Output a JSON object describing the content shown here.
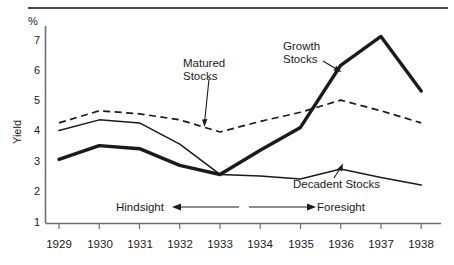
{
  "chart_data": {
    "type": "line",
    "title": "",
    "subtitle": "",
    "xlabel": "",
    "ylabel": "Yield",
    "yunit": "%",
    "categories": [
      "1929",
      "1930",
      "1931",
      "1932",
      "1933",
      "1934",
      "1935",
      "1936",
      "1937",
      "1938"
    ],
    "x": [
      1929,
      1930,
      1931,
      1932,
      1933,
      1934,
      1935,
      1936,
      1937,
      1938
    ],
    "xlim": [
      1929,
      1938
    ],
    "ylim": [
      1,
      7
    ],
    "yticks": [
      1,
      2,
      3,
      4,
      5,
      6,
      7
    ],
    "grid": false,
    "legend": "inline-annotations",
    "series": [
      {
        "name": "Growth Stocks",
        "style": "thick-solid",
        "color": "#1a1a1a",
        "values": [
          3.1,
          3.55,
          3.45,
          2.9,
          2.6,
          3.4,
          4.15,
          6.2,
          7.15,
          5.35
        ]
      },
      {
        "name": "Matured Stocks",
        "style": "dashed",
        "color": "#1a1a1a",
        "values": [
          4.3,
          4.7,
          4.6,
          4.4,
          4.0,
          4.35,
          4.65,
          5.05,
          4.7,
          4.3
        ]
      },
      {
        "name": "Decadent Stocks",
        "style": "thin-solid",
        "color": "#1a1a1a",
        "values": [
          4.05,
          4.4,
          4.3,
          3.6,
          2.6,
          2.55,
          2.45,
          2.78,
          2.5,
          2.25
        ]
      }
    ],
    "annotations": [
      {
        "text": "Matured\nStocks",
        "id": "matured"
      },
      {
        "text": "Growth\nStocks",
        "id": "growth"
      },
      {
        "text": "Decadent Stocks",
        "id": "decadent"
      },
      {
        "text": "Hindsight",
        "id": "hindsight"
      },
      {
        "text": "Foresight",
        "id": "foresight"
      }
    ]
  },
  "axes": {
    "y_unit_symbol": "%",
    "y_title": "Yield",
    "y_tick_labels": [
      "7",
      "6",
      "5",
      "4",
      "3",
      "2",
      "1"
    ],
    "x_tick_labels": [
      "1929",
      "1930",
      "1931",
      "1932",
      "1933",
      "1934",
      "1935",
      "1936",
      "1937",
      "1938"
    ]
  },
  "labels": {
    "matured": "Matured\nStocks",
    "growth": "Growth\nStocks",
    "decadent": "Decadent Stocks",
    "hindsight": "Hindsight",
    "foresight": "Foresight"
  }
}
